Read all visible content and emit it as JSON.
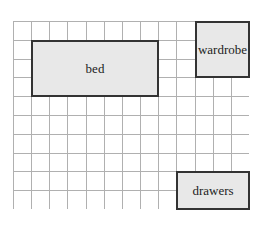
{
  "diagram": {
    "type": "floor-plan-grid",
    "grid": {
      "columns": 13,
      "rows": 10,
      "line_color": "#b0b0b0",
      "border_color": "#999999"
    },
    "furniture": [
      {
        "id": "bed",
        "label": "bed",
        "col": 1,
        "row": 1,
        "width_cells": 7,
        "height_cells": 3,
        "fill": "#e8e8e8"
      },
      {
        "id": "wardrobe",
        "label": "wardrobe",
        "col": 10,
        "row": 0,
        "width_cells": 3,
        "height_cells": 3,
        "fill": "#e8e8e8"
      },
      {
        "id": "drawers",
        "label": "drawers",
        "col": 9,
        "row": 8,
        "width_cells": 4,
        "height_cells": 2,
        "fill": "#e8e8e8"
      }
    ]
  }
}
